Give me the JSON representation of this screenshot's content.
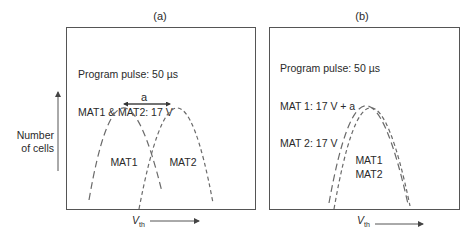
{
  "y_axis": {
    "label_line1": "Number",
    "label_line2": "of cells"
  },
  "x_axis": {
    "label_main": "V",
    "label_sub": "th"
  },
  "panels": [
    {
      "id": "a",
      "title": "(a)",
      "info_lines": [
        "Program pulse: 50 µs",
        "MAT1 & MAT2: 17 V"
      ],
      "curves": [
        {
          "name": "MAT1",
          "label": "MAT1"
        },
        {
          "name": "MAT2",
          "label": "MAT2"
        }
      ],
      "shift_label": "a"
    },
    {
      "id": "b",
      "title": "(b)",
      "info_lines": [
        "Program pulse: 50 µs",
        "MAT 1: 17 V + a",
        "MAT 2: 17 V"
      ],
      "curves_label_line1": "MAT1",
      "curves_label_line2": "MAT2"
    }
  ],
  "colors": {
    "frame": "#555555",
    "curve": "#6a6a6a",
    "text": "#2a2a2a"
  }
}
